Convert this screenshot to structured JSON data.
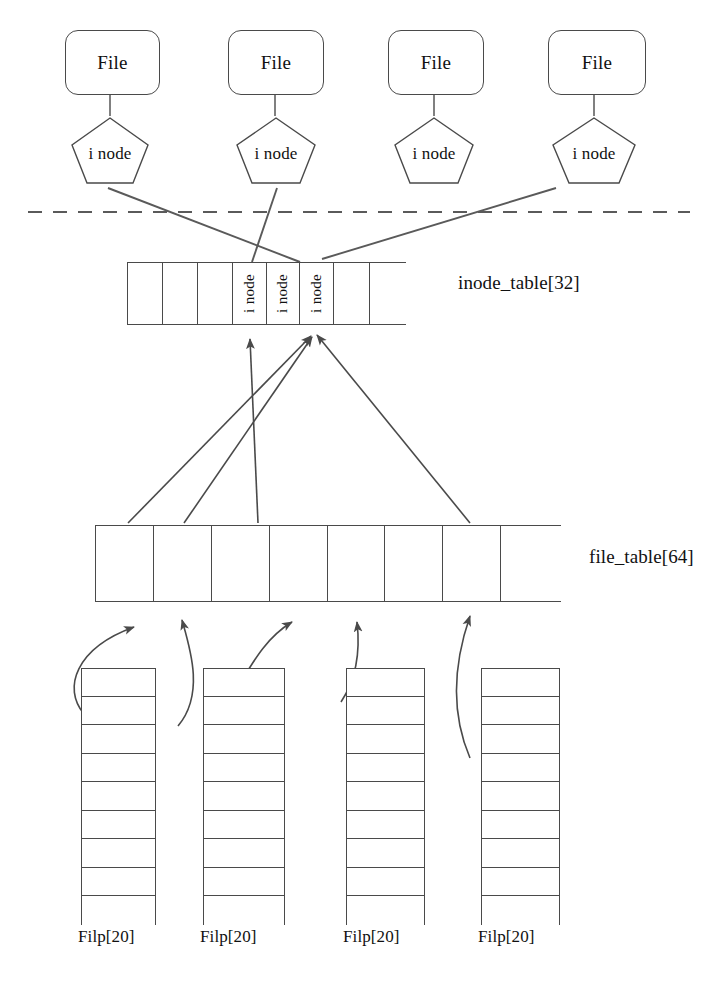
{
  "diagram": {
    "stroke_color": "#4a4a4a",
    "text_color": "#111111",
    "background": "#ffffff"
  },
  "file_nodes": [
    {
      "label": "File",
      "x": 65,
      "y": 30,
      "w": 93,
      "h": 63
    },
    {
      "label": "File",
      "x": 228,
      "y": 30,
      "w": 94,
      "h": 63
    },
    {
      "label": "File",
      "x": 388,
      "y": 30,
      "w": 94,
      "h": 63
    },
    {
      "label": "File",
      "x": 548,
      "y": 30,
      "w": 96,
      "h": 63
    }
  ],
  "inode_nodes": [
    {
      "label": "i node",
      "x": 70,
      "y": 117,
      "w": 80,
      "h": 68
    },
    {
      "label": "i node",
      "x": 235,
      "y": 117,
      "w": 82,
      "h": 68
    },
    {
      "label": "i node",
      "x": 393,
      "y": 117,
      "w": 82,
      "h": 68
    },
    {
      "label": "i node",
      "x": 551,
      "y": 117,
      "w": 86,
      "h": 68
    }
  ],
  "boundary": {
    "name": "kernel-user-boundary",
    "style": "dashed",
    "y": 212,
    "x_start": 28,
    "x_end": 690
  },
  "inode_table": {
    "label": "inode_table[32]",
    "label_x": 458,
    "label_y": 283,
    "x": 127,
    "y": 262,
    "width": 279,
    "height": 63,
    "cell_count": 8,
    "cells": [
      {
        "index": 0,
        "text": ""
      },
      {
        "index": 1,
        "text": ""
      },
      {
        "index": 2,
        "text": ""
      },
      {
        "index": 3,
        "text": "i node"
      },
      {
        "index": 4,
        "text": "i node"
      },
      {
        "index": 5,
        "text": "i node"
      },
      {
        "index": 6,
        "text": ""
      },
      {
        "index": 7,
        "text": ""
      }
    ]
  },
  "file_table": {
    "label": "file_table[64]",
    "label_x": 589,
    "label_y": 557,
    "x": 95,
    "y": 525,
    "width": 466,
    "height": 77,
    "cell_count": 8,
    "cells": [
      {
        "index": 0,
        "text": ""
      },
      {
        "index": 1,
        "text": ""
      },
      {
        "index": 2,
        "text": ""
      },
      {
        "index": 3,
        "text": ""
      },
      {
        "index": 4,
        "text": ""
      },
      {
        "index": 5,
        "text": ""
      },
      {
        "index": 6,
        "text": ""
      },
      {
        "index": 7,
        "text": ""
      }
    ]
  },
  "filp_tables": [
    {
      "label": "Filp[20]",
      "x": 81,
      "y": 668,
      "w": 75,
      "h": 257,
      "rows": 9,
      "label_x": 78,
      "label_y": 934
    },
    {
      "label": "Filp[20]",
      "x": 203,
      "y": 668,
      "w": 82,
      "h": 257,
      "rows": 9,
      "label_x": 200,
      "label_y": 934
    },
    {
      "label": "Filp[20]",
      "x": 346,
      "y": 668,
      "w": 79,
      "h": 257,
      "rows": 9,
      "label_x": 343,
      "label_y": 934
    },
    {
      "label": "Filp[20]",
      "x": 481,
      "y": 668,
      "w": 79,
      "h": 257,
      "rows": 9,
      "label_x": 478,
      "label_y": 934
    }
  ],
  "connectors": {
    "inode_to_table": [
      {
        "from": "inode-node-0",
        "to": "inode-table-cell-4",
        "d": "M 108 186 L 299 262"
      },
      {
        "from": "inode-node-1",
        "to": "inode-table-cell-3",
        "d": "M 275 186 L 253 263"
      },
      {
        "from": "inode-node-3",
        "to": "inode-table-cell-5",
        "d": "M 557 186 L 321 260"
      }
    ],
    "filetable_to_inodetable": [
      {
        "from": "file-table-cell-0",
        "to": "inode-table-cell-5",
        "d": "M 128 524 L 313 334"
      },
      {
        "from": "file-table-cell-1",
        "to": "inode-table-cell-5",
        "d": "M 183 524 L 314 335"
      },
      {
        "from": "file-table-cell-2",
        "to": "inode-table-cell-3",
        "d": "M 257 524 L 250 336"
      },
      {
        "from": "file-table-cell-5",
        "to": "inode-table-cell-5",
        "d": "M 469 524 L 316 333"
      }
    ],
    "filp_to_filetable": [
      {
        "from": "filp-table-0",
        "to": "file-table-cell-0",
        "d": "M 83 712 C 64 690, 80 648, 136 625"
      },
      {
        "from": "filp-table-1",
        "to": "file-table-cell-1",
        "d": "M 180 720 C 203 690, 190 645, 182 620"
      },
      {
        "from": "filp-table-2",
        "to": "file-table-cell-2",
        "d": "M 205 730 C 240 690, 250 645, 290 619"
      },
      {
        "from": "filp-table-3",
        "to": "file-table-cell-4",
        "d": "M 340 700 C 356 676, 360 648, 357 620"
      },
      {
        "from": "filp-table-4",
        "to": "file-table-cell-5",
        "d": "M 470 750 C 448 700, 460 645, 470 614"
      }
    ]
  }
}
